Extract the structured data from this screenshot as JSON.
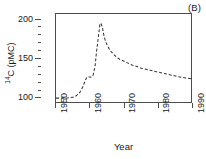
{
  "figure": {
    "panel_label": "(B)",
    "background_color": "#ffffff",
    "axis_color": "#4d4d4d",
    "curve_color": "#333333"
  },
  "axes": {
    "y": {
      "title_prefix": "14",
      "title_main": "C (pMC)",
      "major_labels": [
        "200",
        "150",
        "100"
      ],
      "major_values": [
        200,
        150,
        100
      ],
      "minor_count_between": 4,
      "range": [
        93,
        207
      ]
    },
    "x": {
      "title": "Year",
      "major_labels": [
        "1950",
        "1960",
        "1970",
        "1980",
        "1990"
      ],
      "major_values": [
        1950,
        1960,
        1970,
        1980,
        1990
      ],
      "range": [
        1950,
        1990
      ]
    }
  },
  "chart_data": {
    "type": "line",
    "title": "",
    "subtitle": "",
    "panel": "(B)",
    "xlabel": "Year",
    "ylabel": "14C (pMC)",
    "xlim": [
      1950,
      1990
    ],
    "ylim": [
      93,
      207
    ],
    "grid": false,
    "legend": null,
    "line_style": "dashed",
    "series": [
      {
        "name": "Atmospheric 14C (bomb curve)",
        "x": [
          1950,
          1951,
          1952,
          1953,
          1954,
          1955,
          1956,
          1957,
          1958,
          1958.6,
          1959,
          1959.6,
          1960,
          1960.6,
          1961,
          1961.6,
          1962,
          1962.4,
          1962.8,
          1963,
          1963.3,
          1963.8,
          1964,
          1964.5,
          1965,
          1966,
          1967,
          1968,
          1969,
          1970,
          1971,
          1972,
          1973,
          1974,
          1975,
          1976,
          1977,
          1978,
          1979,
          1980,
          1982,
          1984,
          1986,
          1988,
          1990
        ],
        "y": [
          98,
          98,
          98,
          98,
          98.5,
          99,
          101,
          105,
          113,
          120,
          124,
          126,
          125,
          125.5,
          128,
          140,
          158,
          172,
          186,
          194,
          195,
          189,
          183,
          174,
          168,
          160,
          155,
          151,
          148,
          146,
          144,
          142,
          140,
          139,
          137,
          136,
          135,
          134,
          133,
          132,
          130,
          128,
          126,
          124.5,
          123
        ]
      }
    ]
  }
}
